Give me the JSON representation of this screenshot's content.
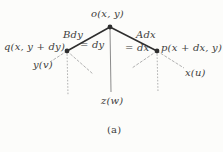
{
  "figure": {
    "caption": "(a)",
    "nodes": [
      {
        "id": "o",
        "label": "o(x, y)"
      },
      {
        "id": "q",
        "label": "q(x, y + dy)"
      },
      {
        "id": "p",
        "label": "p(x + dx, y)"
      }
    ],
    "edge_labels": {
      "left_weight": "Bdy",
      "left_value": "= dy",
      "right_weight": "Adx",
      "right_value": "= dx"
    },
    "terminals": {
      "left": "y(v)",
      "center": "z(w)",
      "right": "x(u)"
    }
  },
  "colors": {
    "background": "#fcfcfa",
    "text": "#3c3c3c",
    "edge": "#2e2e2e",
    "stem": "#6f6f6f",
    "dashed": "#a8a8a8"
  }
}
